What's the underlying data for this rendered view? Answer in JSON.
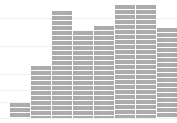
{
  "chart_data": {
    "type": "bar",
    "title": "",
    "subtitle": "",
    "xlabel": "",
    "ylabel": "",
    "legend": [],
    "legend_position": "none",
    "grid": true,
    "grid_color": "#f2f2f2",
    "bar_color": "#adadad",
    "bar_separator_color": "#ffffff",
    "background": "#ffffff",
    "categories": [
      "1",
      "2",
      "3",
      "4",
      "5",
      "6",
      "7",
      "8"
    ],
    "values": [
      15,
      52,
      107,
      87,
      92,
      113,
      113,
      90
    ],
    "ylim": [
      0,
      123
    ],
    "xlim": [
      0,
      177
    ],
    "tick_labels_x": [],
    "tick_labels_y": [],
    "annotations": [],
    "bars": [
      {
        "index": 0,
        "category": "1",
        "value": 15,
        "x": 10,
        "width": 20,
        "top": 103,
        "color": "#adadad"
      },
      {
        "index": 1,
        "category": "2",
        "value": 52,
        "x": 31,
        "width": 20,
        "top": 66,
        "color": "#adadad"
      },
      {
        "index": 2,
        "category": "3",
        "value": 107,
        "x": 52,
        "width": 20,
        "top": 11,
        "color": "#adadad"
      },
      {
        "index": 3,
        "category": "4",
        "value": 87,
        "x": 73,
        "width": 20,
        "top": 31,
        "color": "#adadad"
      },
      {
        "index": 4,
        "category": "5",
        "value": 92,
        "x": 94,
        "width": 20,
        "top": 26,
        "color": "#adadad"
      },
      {
        "index": 5,
        "category": "6",
        "value": 113,
        "x": 115,
        "width": 20,
        "top": 5,
        "color": "#adadad"
      },
      {
        "index": 6,
        "category": "7",
        "value": 113,
        "x": 136,
        "width": 20,
        "top": 5,
        "color": "#adadad"
      },
      {
        "index": 7,
        "category": "8",
        "value": 90,
        "x": 157,
        "width": 20,
        "top": 28,
        "color": "#adadad"
      }
    ],
    "gridlines_y": [
      18,
      46,
      74,
      90,
      102
    ],
    "baseline_y": 118
  }
}
